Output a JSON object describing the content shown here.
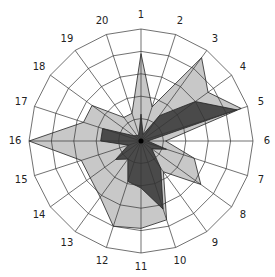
{
  "chart_data": {
    "type": "radar",
    "title": "",
    "categories": [
      "1",
      "2",
      "3",
      "4",
      "5",
      "6",
      "7",
      "8",
      "9",
      "10",
      "11",
      "12",
      "13",
      "14",
      "15",
      "16",
      "17",
      "18",
      "19",
      "20"
    ],
    "rmax": 5,
    "rings": 5,
    "grid": true,
    "legend": null,
    "series": [
      {
        "name": "Series A (light)",
        "color": "#c8c8c8",
        "values": [
          3.9,
          1.6,
          4.6,
          3.7,
          4.7,
          1.1,
          2.5,
          3.3,
          1.7,
          3.7,
          3.9,
          4.0,
          3.1,
          2.8,
          2.8,
          5.0,
          2.7,
          2.7,
          1.3,
          1.3
        ]
      },
      {
        "name": "Series B (dark)",
        "color": "#4a4a4a",
        "values": [
          1.2,
          0.3,
          1.4,
          3.0,
          4.5,
          0.3,
          1.2,
          0.6,
          1.5,
          3.2,
          2.1,
          1.9,
          1.0,
          1.4,
          0.6,
          1.8,
          1.8,
          0.4,
          0.3,
          0.3
        ]
      }
    ]
  },
  "geometry": {
    "cx": 141,
    "cy": 141,
    "radius": 112,
    "label_offset": 14
  }
}
